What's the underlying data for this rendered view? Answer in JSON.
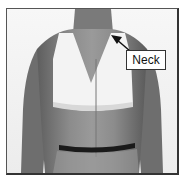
{
  "figure": {
    "callout": {
      "label": "Neck"
    },
    "colors": {
      "skin": "#8a8a8a",
      "garment": "#f2f2f2",
      "waist_band": "#1a1a1a",
      "frame": "#333333"
    }
  }
}
